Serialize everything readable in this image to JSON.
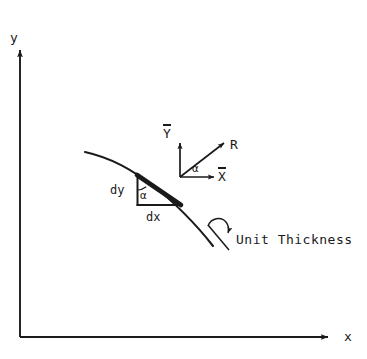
{
  "figure": {
    "type": "engineering-diagram",
    "background_color": "#ffffff",
    "line_color": "#1a1a1a"
  },
  "axes": {
    "y_label": "y",
    "x_label": "x",
    "origin": {
      "x": 20,
      "y": 337
    },
    "y_tip": {
      "x": 20,
      "y": 48
    },
    "x_tip": {
      "x": 330,
      "y": 337
    }
  },
  "local_axes": {
    "y_bar_label": "Y",
    "x_bar_label": "X",
    "origin": {
      "x": 180,
      "y": 177
    }
  },
  "vectors": {
    "resultant_label": "R",
    "resultant_tip": {
      "x": 222,
      "y": 143
    }
  },
  "angles": {
    "alpha_at_origin": "α",
    "alpha_at_triangle": "α"
  },
  "element": {
    "dy_label": "dy",
    "dx_label": "dx",
    "top_left": {
      "x": 137,
      "y": 175
    },
    "bottom_left": {
      "x": 137,
      "y": 205
    },
    "bottom_right": {
      "x": 180,
      "y": 205
    }
  },
  "annotations": {
    "unit_thickness_label": "Unit Thickness"
  },
  "curve": {
    "start": {
      "x": 85,
      "y": 152
    },
    "end": {
      "x": 213,
      "y": 246
    }
  }
}
